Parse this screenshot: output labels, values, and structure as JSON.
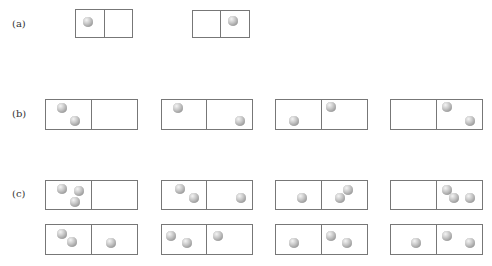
{
  "labels": {
    "a": "(a)",
    "b": "(b)",
    "c": "(c)"
  },
  "colors": {
    "border": "#777777",
    "ball": "#b0b0b0",
    "text": "#333333"
  },
  "rows": [
    {
      "id": "a",
      "label": "(a)",
      "label_pos": [
        12,
        18
      ],
      "boxes": [
        {
          "x": 75,
          "y": 9,
          "w": 58,
          "h": 29,
          "divider": 104,
          "balls": [
            [
              88,
              22
            ]
          ],
          "counts": [
            1,
            0
          ]
        },
        {
          "x": 192,
          "y": 10,
          "w": 58,
          "h": 28,
          "divider": 220,
          "balls": [
            [
              233,
              21
            ]
          ],
          "counts": [
            0,
            1
          ]
        }
      ]
    },
    {
      "id": "b",
      "label": "(b)",
      "label_pos": [
        12,
        108
      ],
      "boxes": [
        {
          "x": 45,
          "y": 99,
          "w": 93,
          "h": 31,
          "divider": 91,
          "balls": [
            [
              62,
              108
            ],
            [
              75,
              121
            ]
          ],
          "counts": [
            2,
            0
          ]
        },
        {
          "x": 161,
          "y": 99,
          "w": 92,
          "h": 31,
          "divider": 206,
          "balls": [
            [
              178,
              108
            ],
            [
              240,
              121
            ]
          ],
          "counts": [
            1,
            1
          ]
        },
        {
          "x": 275,
          "y": 99,
          "w": 93,
          "h": 31,
          "divider": 321,
          "balls": [
            [
              294,
              121
            ],
            [
              331,
              107
            ]
          ],
          "counts": [
            1,
            1
          ]
        },
        {
          "x": 390,
          "y": 99,
          "w": 93,
          "h": 31,
          "divider": 436,
          "balls": [
            [
              447,
              107
            ],
            [
              470,
              121
            ]
          ],
          "counts": [
            0,
            2
          ]
        }
      ]
    },
    {
      "id": "c",
      "label": "(c)",
      "label_pos": [
        12,
        188
      ],
      "boxes": [
        {
          "x": 45,
          "y": 180,
          "w": 93,
          "h": 30,
          "divider": 91,
          "balls": [
            [
              62,
              189
            ],
            [
              79,
              191
            ],
            [
              75,
              202
            ]
          ],
          "counts": [
            3,
            0
          ]
        },
        {
          "x": 161,
          "y": 180,
          "w": 92,
          "h": 30,
          "divider": 206,
          "balls": [
            [
              180,
              189
            ],
            [
              194,
              198
            ],
            [
              241,
              198
            ]
          ],
          "counts": [
            2,
            1
          ]
        },
        {
          "x": 275,
          "y": 180,
          "w": 93,
          "h": 30,
          "divider": 321,
          "balls": [
            [
              302,
              198
            ],
            [
              340,
              198
            ],
            [
              348,
              190
            ]
          ],
          "counts": [
            1,
            2
          ]
        },
        {
          "x": 390,
          "y": 180,
          "w": 93,
          "h": 30,
          "divider": 436,
          "balls": [
            [
              447,
              190
            ],
            [
              454,
              198
            ],
            [
              470,
              198
            ]
          ],
          "counts": [
            0,
            3
          ]
        },
        {
          "x": 45,
          "y": 224,
          "w": 93,
          "h": 31,
          "divider": 91,
          "balls": [
            [
              62,
              234
            ],
            [
              72,
              242
            ],
            [
              111,
              243
            ]
          ],
          "counts": [
            2,
            1
          ]
        },
        {
          "x": 161,
          "y": 224,
          "w": 92,
          "h": 31,
          "divider": 206,
          "balls": [
            [
              171,
              236
            ],
            [
              187,
              243
            ],
            [
              218,
              236
            ]
          ],
          "counts": [
            2,
            1
          ]
        },
        {
          "x": 275,
          "y": 224,
          "w": 93,
          "h": 31,
          "divider": 321,
          "balls": [
            [
              294,
              243
            ],
            [
              331,
              236
            ],
            [
              347,
              243
            ]
          ],
          "counts": [
            1,
            2
          ]
        },
        {
          "x": 390,
          "y": 224,
          "w": 93,
          "h": 31,
          "divider": 436,
          "balls": [
            [
              416,
              243
            ],
            [
              447,
              236
            ],
            [
              470,
              243
            ]
          ],
          "counts": [
            1,
            2
          ]
        }
      ]
    }
  ]
}
